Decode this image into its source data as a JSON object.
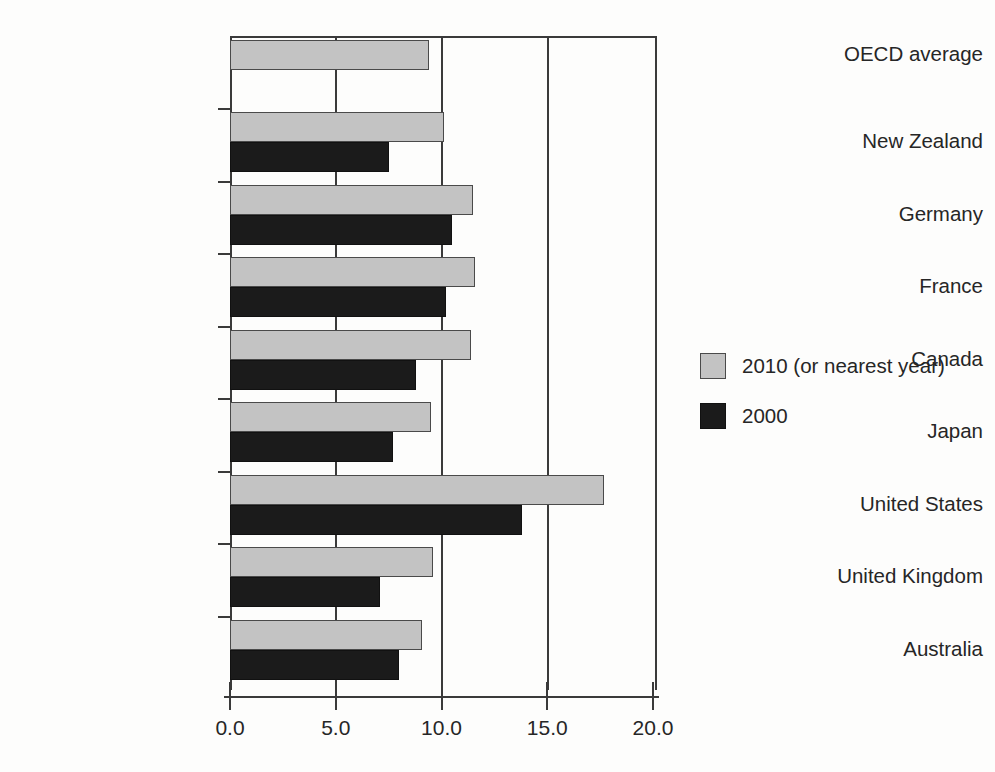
{
  "chart_data": {
    "type": "bar",
    "orientation": "horizontal",
    "title": "",
    "xlabel": "",
    "ylabel": "",
    "xlim": [
      0.0,
      20.0
    ],
    "xticks": [
      "0.0",
      "5.0",
      "10.0",
      "15.0",
      "20.0"
    ],
    "xtick_values": [
      0.0,
      5.0,
      10.0,
      15.0,
      20.0
    ],
    "grid": true,
    "legend_position": "right",
    "categories": [
      "OECD average",
      "New Zealand",
      "Germany",
      "France",
      "Canada",
      "Japan",
      "United States",
      "United Kingdom",
      "Australia"
    ],
    "series": [
      {
        "name": "2010 (or nearest year)",
        "color": "#c3c3c3",
        "values": [
          9.4,
          10.1,
          11.5,
          11.6,
          11.4,
          9.5,
          17.7,
          9.6,
          9.1
        ]
      },
      {
        "name": "2000",
        "color": "#1b1b1b",
        "values": [
          null,
          7.5,
          10.5,
          10.2,
          8.8,
          7.7,
          13.8,
          7.1,
          8.0
        ]
      }
    ]
  },
  "legend": {
    "items": [
      {
        "label": "2010 (or nearest year)",
        "swatch": "light-grey"
      },
      {
        "label": "2000",
        "swatch": "black"
      }
    ]
  },
  "axis": {
    "x_tick_labels": [
      "0.0",
      "5.0",
      "10.0",
      "15.0",
      "20.0"
    ],
    "y_tick_labels": [
      "OECD average",
      "New Zealand",
      "Germany",
      "France",
      "Canada",
      "Japan",
      "United States",
      "United Kingdom",
      "Australia"
    ]
  }
}
